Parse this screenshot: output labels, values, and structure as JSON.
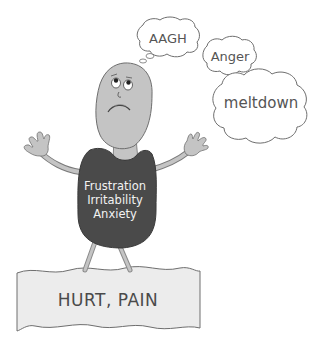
{
  "illustration": {
    "thought_bubbles": [
      {
        "id": "aagh",
        "text": "AAGH"
      },
      {
        "id": "anger",
        "text": "Anger"
      },
      {
        "id": "meltdown",
        "text": "meltdown"
      }
    ],
    "shirt_lines": [
      "Frustration",
      "Irritability",
      "Anxiety"
    ],
    "ground_label": "HURT, PAIN",
    "colors": {
      "skin": "#bdbdbd",
      "shirt": "#4a4a4a",
      "outline": "#6e6e6e",
      "ground": "#ececec",
      "cloud": "#ffffff"
    }
  }
}
